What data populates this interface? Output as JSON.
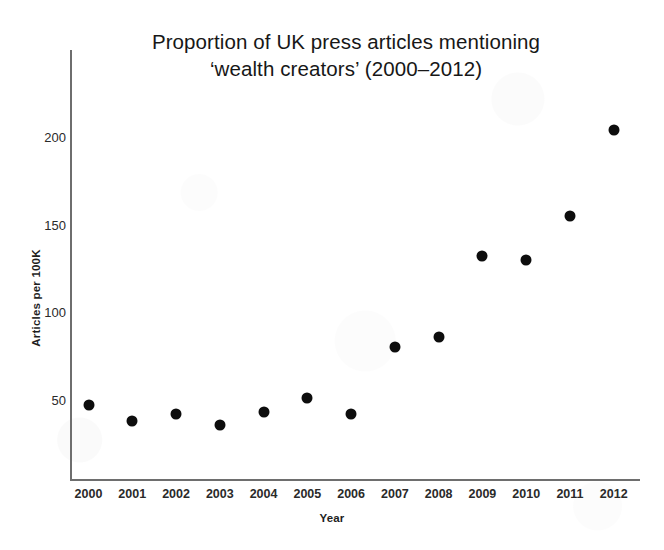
{
  "figure": {
    "title_line1": "Proportion of UK press articles mentioning",
    "title_line2": "‘wealth creators’ (2000–2012)",
    "background_color": "#ffffff",
    "axis_color": "#6e6e6e",
    "marker_color": "#0d0d0d"
  },
  "chart_data": {
    "type": "scatter",
    "title": "Proportion of UK press articles mentioning ‘wealth creators’ (2000–2012)",
    "xlabel": "Year",
    "ylabel": "Articles per 100K",
    "categories": [
      "2000",
      "2001",
      "2002",
      "2003",
      "2004",
      "2005",
      "2006",
      "2007",
      "2008",
      "2009",
      "2010",
      "2011",
      "2012"
    ],
    "x": [
      2000,
      2001,
      2002,
      2003,
      2004,
      2005,
      2006,
      2007,
      2008,
      2009,
      2010,
      2011,
      2012
    ],
    "values": [
      47,
      38,
      42,
      36,
      43,
      51,
      42,
      80,
      86,
      132,
      130,
      155,
      204
    ],
    "series": [
      {
        "name": "Articles per 100K",
        "values": [
          47,
          38,
          42,
          36,
          43,
          51,
          42,
          80,
          86,
          132,
          130,
          155,
          204
        ]
      }
    ],
    "xlim": [
      1999.6,
      2012.6
    ],
    "ylim": [
      0,
      245
    ],
    "ytick_labels": [
      "50",
      "100",
      "150",
      "200"
    ],
    "ytick_values": [
      50,
      100,
      150,
      200
    ],
    "xtick_labels": [
      "2000",
      "2001",
      "2002",
      "2003",
      "2004",
      "2005",
      "2006",
      "2007",
      "2008",
      "2009",
      "2010",
      "2011",
      "2012"
    ],
    "grid": false,
    "legend": false,
    "marker": "filled-circle"
  }
}
